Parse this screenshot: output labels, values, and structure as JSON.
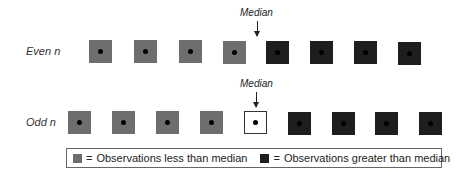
{
  "rows": {
    "even": {
      "label": "Even n",
      "median_label": "Median",
      "observations": [
        "less",
        "less",
        "less",
        "less",
        "greater",
        "greater",
        "greater",
        "greater"
      ]
    },
    "odd": {
      "label": "Odd n",
      "median_label": "Median",
      "observations": [
        "less",
        "less",
        "less",
        "less",
        "median",
        "greater",
        "greater",
        "greater",
        "greater"
      ]
    }
  },
  "legend": {
    "less": {
      "symbol": "=",
      "text": "Observations less than median",
      "color": "#6e6e6e"
    },
    "greater": {
      "symbol": "=",
      "text": "Observations greater than median",
      "color": "#1e1e1e"
    }
  },
  "colors": {
    "less": "#6e6e6e",
    "greater": "#1e1e1e",
    "median": "#ffffff",
    "dot": "#000000"
  }
}
